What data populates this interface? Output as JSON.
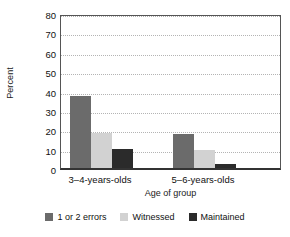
{
  "chart_data": {
    "type": "bar",
    "title": "",
    "xlabel": "Age of group",
    "ylabel": "Percent",
    "categories": [
      "3–4-years-olds",
      "5–6-years-olds"
    ],
    "series": [
      {
        "name": "1 or 2 errors",
        "values": [
          37,
          17.5
        ],
        "color": "#6b6b6b"
      },
      {
        "name": "Witnessed",
        "values": [
          18,
          9.5
        ],
        "color": "#d2d2d2"
      },
      {
        "name": "Maintained",
        "values": [
          10,
          2
        ],
        "color": "#2b2b2b"
      }
    ],
    "ylim": [
      0,
      80
    ],
    "ytick_step": 10,
    "yticks": [
      "0",
      "10",
      "20",
      "30",
      "40",
      "50",
      "60",
      "70",
      "80"
    ],
    "grid": true,
    "grid_axis": "y",
    "grid_style": "dotted",
    "legend_position": "bottom"
  },
  "axis": {
    "y_title": "Percent",
    "x_title": "Age of group"
  }
}
